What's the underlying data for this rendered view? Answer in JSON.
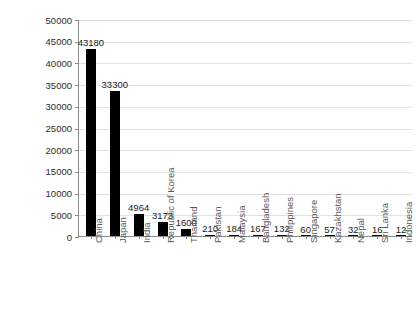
{
  "chart_data": {
    "type": "bar",
    "title": "",
    "xlabel": "",
    "ylabel": "Total installed capacity (MW)",
    "ylim": [
      0,
      50000
    ],
    "ytick_step": 5000,
    "grid": true,
    "legend": "none",
    "orientation": "vertical",
    "bar_color": "#000000",
    "categories": [
      "China",
      "Japan",
      "India",
      "Republic of Korea",
      "Thailand",
      "Pakistan",
      "Malaysia",
      "Bangladesh",
      "Philippines",
      "Singapore",
      "Kazakhstan",
      "Nepal",
      "Sri Lanka",
      "Indonesia"
    ],
    "values": [
      43180,
      33300,
      4964,
      3173,
      1600,
      210,
      184,
      167,
      132,
      60,
      57,
      32,
      16,
      12
    ],
    "value_labels": [
      "43180",
      "33300",
      "4964",
      "3173",
      "1600",
      "210",
      "184",
      "167",
      "132",
      "60",
      "57",
      "32",
      "16",
      "12"
    ],
    "ytick_labels": [
      "50000",
      "45000",
      "40000",
      "35000",
      "30000",
      "25000",
      "20000",
      "15000",
      "10000",
      "5000",
      "0"
    ],
    "ytick_values": [
      50000,
      45000,
      40000,
      35000,
      30000,
      25000,
      20000,
      15000,
      10000,
      5000,
      0
    ]
  },
  "colors": {
    "bar": "#000000",
    "grid": "#e2e2e2",
    "axis": "#8a8a8a",
    "tick_text": "#2b2b2b",
    "category_text": "#5a5a5a",
    "title_text": "#1a1a1a",
    "background": "#ffffff"
  }
}
